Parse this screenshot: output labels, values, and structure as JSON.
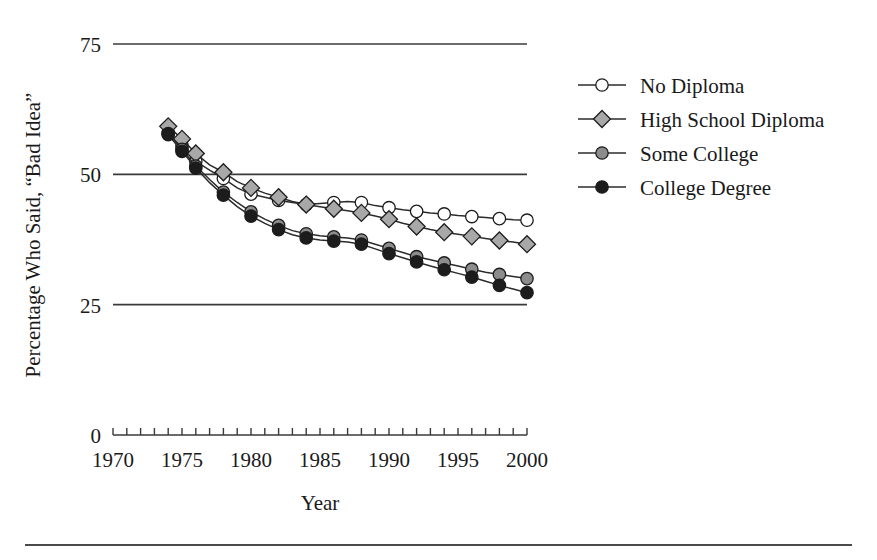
{
  "figure": {
    "background_color": "#ffffff",
    "line_color": "#2b2b2b",
    "footer_rule": true
  },
  "chart_data": {
    "type": "line",
    "title": "",
    "subtitle": "",
    "xlabel": "Year",
    "ylabel": "Percentage Who Said, “Bad Idea”",
    "xlim": [
      1970,
      2000
    ],
    "ylim": [
      0,
      75
    ],
    "xticks": [
      1970,
      1975,
      1980,
      1985,
      1990,
      1995,
      2000
    ],
    "xtick_labels": [
      "1970",
      "1975",
      "1980",
      "1985",
      "1990",
      "1995",
      "2000"
    ],
    "yticks": [
      0,
      25,
      50,
      75
    ],
    "ytick_labels": [
      "0",
      "25",
      "50",
      "75"
    ],
    "minor_xtick_interval": 1,
    "grid": "horizontal-only",
    "legend_position": "right",
    "x": [
      1974,
      1975,
      1976,
      1977,
      1978,
      1979,
      1980,
      1981,
      1982,
      1983,
      1984,
      1985,
      1986,
      1987,
      1988,
      1989,
      1990,
      1991,
      1992,
      1993,
      1994,
      1995,
      1996,
      1997,
      1998,
      1999,
      2000
    ],
    "series": [
      {
        "name": "No Diploma",
        "marker": "open-circle",
        "marker_fill": "#ffffff",
        "marker_edge": "#1c1c1c",
        "values": [
          58.0,
          55.5,
          52.5,
          50.8,
          49.2,
          47.4,
          46.2,
          45.6,
          45.0,
          44.6,
          44.2,
          44.4,
          44.6,
          44.8,
          44.6,
          44.0,
          43.6,
          43.2,
          42.9,
          42.6,
          42.4,
          42.1,
          41.9,
          41.7,
          41.5,
          41.3,
          41.2
        ]
      },
      {
        "name": "High School Diploma",
        "marker": "diamond",
        "marker_fill": "#a8a8a8",
        "marker_edge": "#1c1c1c",
        "values": [
          59.2,
          56.8,
          54.0,
          51.8,
          50.4,
          48.6,
          47.4,
          46.4,
          45.6,
          44.8,
          44.2,
          43.8,
          43.4,
          43.0,
          42.6,
          42.0,
          41.4,
          40.6,
          40.0,
          39.4,
          38.9,
          38.5,
          38.1,
          37.7,
          37.3,
          37.0,
          36.6
        ]
      },
      {
        "name": "Some College",
        "marker": "filled-circle-gray",
        "marker_fill": "#8c8c8c",
        "marker_edge": "#1c1c1c",
        "values": [
          57.8,
          54.8,
          51.6,
          49.0,
          46.6,
          44.6,
          42.8,
          41.4,
          40.2,
          39.2,
          38.6,
          38.2,
          38.0,
          37.8,
          37.4,
          36.6,
          35.8,
          35.0,
          34.2,
          33.6,
          33.0,
          32.4,
          31.8,
          31.2,
          30.8,
          30.4,
          30.0
        ]
      },
      {
        "name": "College Degree",
        "marker": "filled-circle-black",
        "marker_fill": "#1c1c1c",
        "marker_edge": "#1c1c1c",
        "values": [
          57.6,
          54.4,
          51.2,
          48.4,
          46.0,
          43.8,
          42.0,
          40.6,
          39.4,
          38.4,
          37.8,
          37.4,
          37.2,
          37.0,
          36.6,
          35.7,
          34.8,
          34.0,
          33.2,
          32.4,
          31.7,
          31.0,
          30.3,
          29.5,
          28.7,
          28.0,
          27.3
        ]
      }
    ]
  },
  "legend": {
    "entries": [
      {
        "label": "No Diploma",
        "marker": "open-circle"
      },
      {
        "label": "High School Diploma",
        "marker": "diamond"
      },
      {
        "label": "Some College",
        "marker": "filled-circle-gray"
      },
      {
        "label": "College Degree",
        "marker": "filled-circle-black"
      }
    ]
  }
}
